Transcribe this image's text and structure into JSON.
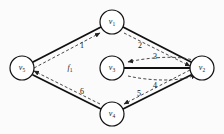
{
  "figure": {
    "background_color": "#fbfbfb",
    "stroke_color": "#111111",
    "dash_color": "#444444"
  },
  "nodes": [
    {
      "id": "v1",
      "label": "v",
      "sub": "1",
      "cx": 112,
      "cy": 22,
      "r": 12
    },
    {
      "id": "v5",
      "label": "v",
      "sub": "5",
      "cx": 22,
      "cy": 68,
      "r": 12
    },
    {
      "id": "v3",
      "label": "v",
      "sub": "3",
      "cx": 112,
      "cy": 68,
      "r": 12
    },
    {
      "id": "v2",
      "label": "v",
      "sub": "2",
      "cx": 202,
      "cy": 68,
      "r": 12
    },
    {
      "id": "v4",
      "label": "v",
      "sub": "4",
      "cx": 112,
      "cy": 114,
      "r": 12
    }
  ],
  "edges": [
    {
      "id": "e1",
      "label": "1",
      "from": "v5",
      "to": "v1",
      "lx": 82,
      "ly": 45,
      "style": "solid+dashed-arrow"
    },
    {
      "id": "e2",
      "label": "2",
      "from": "v1",
      "to": "v2",
      "lx": 140,
      "ly": 45,
      "style": "solid+dashed-arrow"
    },
    {
      "id": "e3",
      "label": "3",
      "from": "v2",
      "to": "v3",
      "lx": 155,
      "ly": 58,
      "style": "dashed-arrow"
    },
    {
      "id": "e4",
      "label": "4",
      "from": "v3",
      "to": "v2",
      "lx": 155,
      "ly": 83,
      "style": "dashed-arrow"
    },
    {
      "id": "e5",
      "label": "5",
      "from": "v2",
      "to": "v4",
      "lx": 140,
      "ly": 92,
      "style": "solid+dashed-arrow"
    },
    {
      "id": "e6",
      "label": "6",
      "from": "v4",
      "to": "v5",
      "lx": 82,
      "ly": 91,
      "style": "solid+dashed-arrow"
    }
  ],
  "faces": [
    {
      "id": "f1",
      "label": "f",
      "sub": "1",
      "lx": 70,
      "ly": 68
    }
  ]
}
